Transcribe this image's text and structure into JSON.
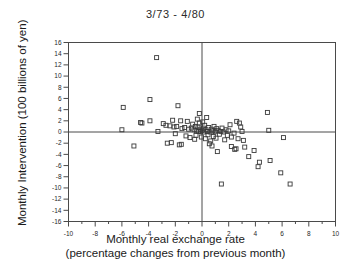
{
  "chart_data": {
    "type": "scatter",
    "title": "3/73 - 4/80",
    "xlabel": "Monthly real exchange rate",
    "xlabel_line2": "(percentage changes from previous month)",
    "ylabel": "Monthly Intervention (100 billions of yen)",
    "xlim": [
      -10,
      10
    ],
    "ylim": [
      -16,
      16
    ],
    "xticks": [
      -10,
      -8,
      -6,
      -4,
      -2,
      0,
      2,
      4,
      6,
      8,
      10
    ],
    "xtick_labels": [
      "-10",
      "-8",
      "-6",
      "-4",
      "-2",
      "0",
      "2",
      "4",
      "6",
      "8",
      "10"
    ],
    "xminor_step": 1,
    "yticks": [
      16,
      14,
      12,
      10,
      8,
      6,
      4,
      2,
      0,
      -2,
      -4,
      -6,
      -8,
      -10,
      -12,
      -14,
      -16
    ],
    "ytick_labels": [
      "16",
      "14",
      "12",
      "10",
      "8",
      "6",
      "4",
      "2",
      "0",
      "-2",
      "-4",
      "-6",
      "-8",
      "-10",
      "-12",
      "-14",
      "-16"
    ],
    "grid": false,
    "zero_lines": true,
    "legend": null,
    "marker": "open-square",
    "marker_size_px": 4,
    "marker_color": "#3a3a3a",
    "frame_color": "#4a4a4a",
    "points": [
      [
        -3.4,
        13.3
      ],
      [
        -3.9,
        5.8
      ],
      [
        -5.9,
        4.4
      ],
      [
        -1.8,
        4.7
      ],
      [
        -0.2,
        3.3
      ],
      [
        4.9,
        3.5
      ],
      [
        -4.6,
        1.7
      ],
      [
        -4.5,
        1.6
      ],
      [
        -3.9,
        2.0
      ],
      [
        -2.9,
        1.5
      ],
      [
        -2.7,
        1.2
      ],
      [
        -2.4,
        1.1
      ],
      [
        -2.2,
        2.1
      ],
      [
        -2.1,
        0.9
      ],
      [
        -1.9,
        1.0
      ],
      [
        -1.6,
        2.0
      ],
      [
        -1.5,
        0.6
      ],
      [
        -1.3,
        0.8
      ],
      [
        -1.1,
        1.9
      ],
      [
        -1.0,
        0.5
      ],
      [
        -0.8,
        0.7
      ],
      [
        -0.7,
        1.4
      ],
      [
        -0.6,
        0.4
      ],
      [
        -0.5,
        1.0
      ],
      [
        -0.4,
        0.2
      ],
      [
        -0.35,
        2.3
      ],
      [
        -0.3,
        0.9
      ],
      [
        -0.25,
        0.1
      ],
      [
        -0.2,
        1.6
      ],
      [
        -0.15,
        0.5
      ],
      [
        -0.1,
        0.05
      ],
      [
        0.0,
        0.3
      ],
      [
        0.05,
        1.8
      ],
      [
        0.1,
        0.7
      ],
      [
        0.15,
        0.0
      ],
      [
        0.2,
        1.2
      ],
      [
        0.3,
        0.4
      ],
      [
        0.35,
        2.6
      ],
      [
        0.4,
        0.1
      ],
      [
        0.5,
        0.8
      ],
      [
        0.6,
        0.0
      ],
      [
        0.7,
        0.5
      ],
      [
        0.8,
        0.2
      ],
      [
        0.9,
        1.0
      ],
      [
        1.0,
        0.05
      ],
      [
        1.1,
        0.6
      ],
      [
        1.2,
        0.3
      ],
      [
        1.4,
        0.1
      ],
      [
        1.5,
        0.7
      ],
      [
        1.6,
        0.0
      ],
      [
        1.8,
        0.4
      ],
      [
        2.0,
        0.2
      ],
      [
        2.1,
        1.3
      ],
      [
        2.6,
        1.9
      ],
      [
        2.8,
        1.6
      ],
      [
        2.9,
        0.9
      ],
      [
        3.0,
        0.1
      ],
      [
        5.0,
        0.3
      ],
      [
        -6.0,
        0.4
      ],
      [
        -3.3,
        0.1
      ],
      [
        -2.0,
        -0.3
      ],
      [
        -1.2,
        -0.7
      ],
      [
        -0.9,
        -1.0
      ],
      [
        -0.55,
        -1.3
      ],
      [
        -0.45,
        -0.6
      ],
      [
        -0.05,
        -0.9
      ],
      [
        0.25,
        -1.2
      ],
      [
        0.45,
        -0.5
      ],
      [
        0.65,
        -1.6
      ],
      [
        0.85,
        -0.8
      ],
      [
        1.05,
        -1.1
      ],
      [
        1.3,
        -0.4
      ],
      [
        1.7,
        -1.4
      ],
      [
        1.9,
        -0.6
      ],
      [
        2.2,
        -0.9
      ],
      [
        2.4,
        -0.2
      ],
      [
        2.7,
        -1.2
      ],
      [
        3.1,
        -1.5
      ],
      [
        -2.6,
        -2.0
      ],
      [
        -2.3,
        -1.9
      ],
      [
        -1.7,
        -2.3
      ],
      [
        -1.55,
        -2.2
      ],
      [
        -5.1,
        -2.5
      ],
      [
        0.55,
        -2.1
      ],
      [
        0.75,
        -2.5
      ],
      [
        1.15,
        -3.5
      ],
      [
        1.45,
        -9.3
      ],
      [
        2.2,
        -2.6
      ],
      [
        2.55,
        -3.0
      ],
      [
        2.45,
        -3.1
      ],
      [
        3.2,
        -2.7
      ],
      [
        3.9,
        -3.3
      ],
      [
        3.5,
        -4.4
      ],
      [
        4.2,
        -6.2
      ],
      [
        4.3,
        -5.4
      ],
      [
        5.1,
        -5.1
      ],
      [
        5.9,
        -7.3
      ],
      [
        6.1,
        -1.0
      ],
      [
        6.6,
        -9.3
      ]
    ]
  }
}
